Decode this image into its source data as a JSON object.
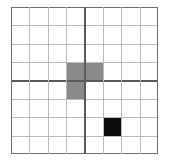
{
  "figure": {
    "name": "grid-with-shaded-cells",
    "width_px": 170,
    "height_px": 167
  },
  "grid": {
    "columns": 8,
    "rows": 8,
    "origin_x_px": 11,
    "origin_y_px": 7,
    "size_px": 147,
    "cell_size_px": 18.375,
    "quadrant_divider_column": 4,
    "quadrant_divider_row": 4,
    "background_color": "#ffffff",
    "thin_line_color": "#b9b9b9",
    "thin_line_width_px": 1,
    "thick_line_color": "#5a5a5a",
    "thick_line_width_px": 2,
    "border_color": "#6e6e6e",
    "border_width_px": 1
  },
  "pieces": [
    {
      "id": "gray-l-shape",
      "label": "gray L-shaped region",
      "color": "#8a8a8a",
      "cells": [
        {
          "col": 4,
          "row": 4
        },
        {
          "col": 5,
          "row": 4
        },
        {
          "col": 4,
          "row": 5
        }
      ]
    },
    {
      "id": "black-square",
      "label": "black single cell",
      "color": "#0d0d0d",
      "cells": [
        {
          "col": 6,
          "row": 7
        }
      ]
    }
  ]
}
